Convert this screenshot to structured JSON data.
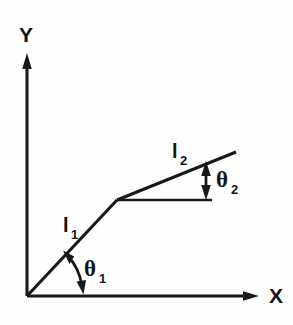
{
  "figure": {
    "background_color": "#fefefe",
    "ink_color": "#17181a",
    "width": 293,
    "height": 325
  },
  "axes": {
    "y_axis": {
      "label": "Y",
      "label_x": 26,
      "label_y": 42,
      "line_x": 27,
      "line_top": 57,
      "line_bottom": 296,
      "arrow": "up-arrowhead"
    },
    "x_axis": {
      "label": "X",
      "label_x": 276,
      "label_y": 303,
      "line_y": 296,
      "line_left": 27,
      "line_right": 258,
      "arrow": "right-arrowhead"
    },
    "origin": {
      "x": 27,
      "y": 296
    }
  },
  "segments": [
    {
      "name": "segment-l1",
      "label": "l",
      "subscript": "1",
      "label_x": 63,
      "label_y": 232,
      "from": {
        "x": 27,
        "y": 296
      },
      "to": {
        "x": 117,
        "y": 200
      }
    },
    {
      "name": "segment-l2",
      "label": "l",
      "subscript": "2",
      "label_x": 172,
      "label_y": 158,
      "from": {
        "x": 117,
        "y": 200
      },
      "to": {
        "x": 236,
        "y": 152
      }
    }
  ],
  "reference_line": {
    "name": "horizontal-reference",
    "from": {
      "x": 117,
      "y": 200
    },
    "to": {
      "x": 212,
      "y": 200
    }
  },
  "angles": [
    {
      "name": "angle-theta-1",
      "label": "θ",
      "subscript": "1",
      "label_x": 84,
      "label_y": 276,
      "type": "arc",
      "vertex": {
        "x": 27,
        "y": 296
      },
      "radius": 56,
      "between": [
        "x-axis",
        "segment-l1"
      ],
      "arrow_style": "double-headed"
    },
    {
      "name": "angle-theta-2",
      "label": "θ",
      "subscript": "2",
      "label_x": 216,
      "label_y": 187,
      "type": "vertical-span",
      "x": 206,
      "top_y": 163,
      "bottom_y": 199,
      "between": [
        "horizontal-reference",
        "segment-l2"
      ],
      "arrow_style": "double-headed"
    }
  ]
}
